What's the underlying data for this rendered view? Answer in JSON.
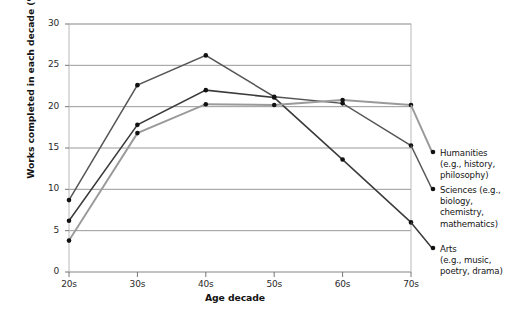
{
  "chart_data": {
    "type": "line",
    "title": "",
    "xlabel": "Age decade",
    "ylabel": "Works completed in each decade (%)",
    "categories": [
      "20s",
      "30s",
      "40s",
      "50s",
      "60s",
      "70s"
    ],
    "ylim": [
      0,
      30
    ],
    "yticks": [
      0,
      5,
      10,
      15,
      20,
      25,
      30
    ],
    "grid": "horizontal",
    "legend_position": "right",
    "series": [
      {
        "name": "Humanities",
        "description": "(e.g., history, philosophy)",
        "color": "#555555",
        "values": [
          8.7,
          22.6,
          26.2,
          21.2,
          20.4,
          15.3
        ]
      },
      {
        "name": "Sciences (e.g.,",
        "description": "biology, chemistry, mathematics)",
        "color": "#3a3a3a",
        "values": [
          6.2,
          17.8,
          22.0,
          21.1,
          13.6,
          6.0
        ]
      },
      {
        "name": "Arts",
        "description": "(e.g., music, poetry, drama)",
        "color": "#9a9a9a",
        "values": [
          3.8,
          16.8,
          20.3,
          20.2,
          20.8,
          20.2
        ]
      }
    ]
  },
  "legend": [
    {
      "label": "Humanities",
      "sublines": [
        "(e.g., history,",
        "philosophy)"
      ],
      "top": 148
    },
    {
      "label": "Sciences (e.g.,",
      "sublines": [
        "biology,",
        "chemistry,",
        "mathematics)"
      ],
      "top": 185
    },
    {
      "label": "Arts",
      "sublines": [
        "(e.g., music,",
        "poetry, drama)"
      ],
      "top": 244
    }
  ],
  "edge_fragment": {
    "text": ""
  }
}
